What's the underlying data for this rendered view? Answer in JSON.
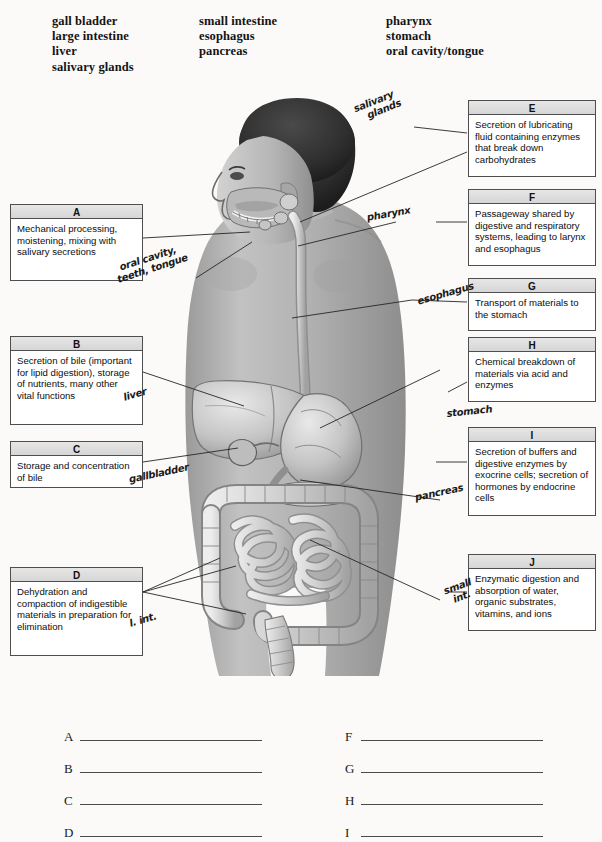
{
  "word_bank": {
    "columns": [
      [
        "gall bladder",
        "large intestine",
        "liver",
        "salivary glands"
      ],
      [
        "small intestine",
        "esophagus",
        "pancreas"
      ],
      [
        "pharynx",
        "stomach",
        "oral cavity/tongue"
      ]
    ]
  },
  "boxes": {
    "a": {
      "letter": "A",
      "text": "Mechanical processing, moistening, mixing with salivary secretions"
    },
    "b": {
      "letter": "B",
      "text": "Secretion of bile (important for lipid digestion), storage of nutrients, many other vital functions"
    },
    "c": {
      "letter": "C",
      "text": "Storage and concentration of bile"
    },
    "d": {
      "letter": "D",
      "text": "Dehydration and compaction of indigestible materials in preparation for elimination"
    },
    "e": {
      "letter": "E",
      "text": "Secretion of lubricating fluid containing enzymes that break down carbohydrates"
    },
    "f": {
      "letter": "F",
      "text": "Passageway shared by digestive and respiratory systems, leading to larynx and esophagus"
    },
    "g": {
      "letter": "G",
      "text": "Transport of materials to the stomach"
    },
    "h": {
      "letter": "H",
      "text": "Chemical breakdown of materials via acid and enzymes"
    },
    "i": {
      "letter": "I",
      "text": "Secretion of buffers and digestive enzymes by exocrine cells; secretion of hormones by endocrine cells"
    },
    "j": {
      "letter": "J",
      "text": "Enzymatic digestion and absorption of water, organic substrates, vitamins, and ions"
    }
  },
  "handwriting": [
    {
      "id": "salivary-glands",
      "line1": "salivary",
      "line2": "glands"
    },
    {
      "id": "pharynx",
      "text": "pharynx"
    },
    {
      "id": "oral-cavity",
      "line1": "oral cavity,",
      "line2": "teeth, tongue"
    },
    {
      "id": "esophagus",
      "text": "esophagus"
    },
    {
      "id": "liver",
      "text": "liver"
    },
    {
      "id": "stomach",
      "text": "stomach"
    },
    {
      "id": "gallbladder",
      "text": "gallbladder"
    },
    {
      "id": "pancreas",
      "text": "pancreas"
    },
    {
      "id": "large-intestine",
      "text": "l. int."
    },
    {
      "id": "small-intestine",
      "line1": "small",
      "line2": "int."
    }
  ],
  "answer_lines": {
    "left": [
      "A",
      "B",
      "C",
      "D",
      "E"
    ],
    "right": [
      "F",
      "G",
      "H",
      "I",
      "J"
    ]
  },
  "colors": {
    "page_background": "#fbfaf8",
    "box_header": "#dedede",
    "box_border": "#4e4e4e",
    "ink": "#111111",
    "leader_line": "#2b2b2b"
  }
}
